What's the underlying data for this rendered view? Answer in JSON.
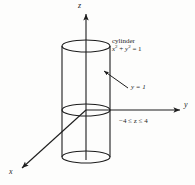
{
  "figure": {
    "background_color": "#fdfdfc",
    "stroke_color": "#1d1d1d"
  },
  "axes": {
    "z_label": "z",
    "y_label": "y",
    "x_label": "x",
    "origin": {
      "x": 86,
      "y": 110
    }
  },
  "annotations": {
    "cylinder_title": "cylinder",
    "cylinder_equation_prefix": "x",
    "cylinder_equation_exp1": "2",
    "cylinder_equation_plus": " + ",
    "cylinder_equation_var2": "y",
    "cylinder_equation_exp2": "2",
    "cylinder_equation_suffix": " = 1",
    "surface_label": "y = 1",
    "z_range_label": "−4 ≤ z ≤ 4"
  },
  "shape": {
    "name": "cylinder",
    "center_x": 86,
    "radius_x": 24,
    "radius_y": 6,
    "top_y": 46,
    "mid_y": 110,
    "bottom_y": 157
  }
}
